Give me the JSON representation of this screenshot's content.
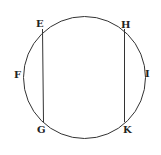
{
  "diagram": {
    "type": "geometry",
    "circle": {
      "cx": 84,
      "cy": 77,
      "r": 60,
      "stroke": "#333333"
    },
    "points": [
      {
        "label": "E",
        "x": 43,
        "y": 33
      },
      {
        "label": "F",
        "x": 24,
        "y": 77
      },
      {
        "label": "G",
        "x": 43,
        "y": 121
      },
      {
        "label": "H",
        "x": 125,
        "y": 33
      },
      {
        "label": "I",
        "x": 145,
        "y": 77
      },
      {
        "label": "K",
        "x": 125,
        "y": 121
      }
    ],
    "segments": [
      {
        "from": "E",
        "to": "G"
      },
      {
        "from": "H",
        "to": "K"
      }
    ],
    "labels": {
      "E": "E",
      "F": "F",
      "G": "G",
      "H": "H",
      "I": "I",
      "K": "K"
    }
  }
}
